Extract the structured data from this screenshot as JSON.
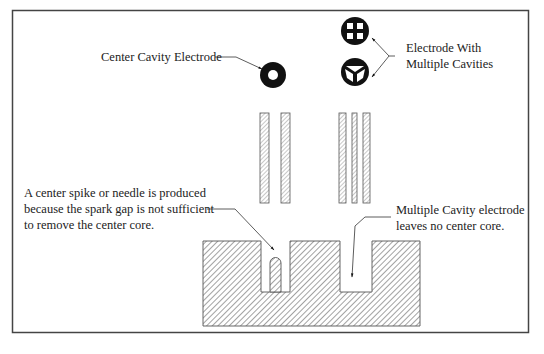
{
  "diagram": {
    "labels": {
      "center_cavity": "Center Cavity Electrode",
      "multi_cavity_line1": "Electrode With",
      "multi_cavity_line2": "Multiple Cavities",
      "spike_line1": "A center spike or needle is produced",
      "spike_line2": "because the spark gap is not sufficient",
      "spike_line3": "to remove the center core.",
      "no_core_line1": "Multiple Cavity electrode",
      "no_core_line2": "leaves no center core."
    },
    "colors": {
      "frame": "#444444",
      "ink": "#111111",
      "hatch": "#888888",
      "background": "#ffffff"
    }
  }
}
